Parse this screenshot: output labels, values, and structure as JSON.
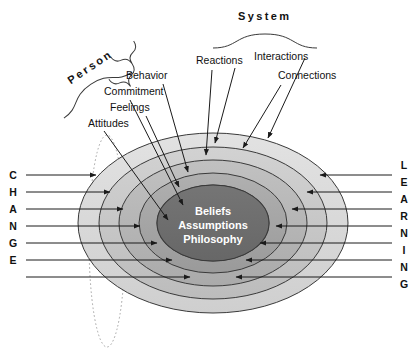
{
  "diagram": {
    "title_groups": [
      {
        "name": "person-group-label",
        "text": "Person"
      },
      {
        "name": "system-group-label",
        "text": "System"
      }
    ],
    "center": {
      "lines": [
        "Beliefs",
        "Assumptions",
        "Philosophy"
      ]
    },
    "person_labels": [
      {
        "text": "Behavior",
        "x": 126,
        "y": 79
      },
      {
        "text": "Commitment",
        "x": 104,
        "y": 95
      },
      {
        "text": "Feelings",
        "x": 110,
        "y": 111
      },
      {
        "text": "Attitudes",
        "x": 88,
        "y": 127
      }
    ],
    "system_labels": [
      {
        "text": "Reactions",
        "x": 196,
        "y": 64
      },
      {
        "text": "Interactions",
        "x": 254,
        "y": 60
      },
      {
        "text": "Connections",
        "x": 278,
        "y": 79
      }
    ],
    "left_axis": {
      "name": "change",
      "letters": [
        "C",
        "H",
        "A",
        "N",
        "G",
        "E"
      ]
    },
    "right_axis": {
      "name": "learning",
      "letters": [
        "L",
        "E",
        "A",
        "R",
        "N",
        "I",
        "N",
        "G"
      ]
    },
    "rings": [
      {
        "index": 0,
        "label": "Attitudes",
        "fill": "#d5d5d5"
      },
      {
        "index": 1,
        "label": "Feelings",
        "fill": "#c3c3c3"
      },
      {
        "index": 2,
        "label": "Commitment",
        "fill": "#b2b2b2"
      },
      {
        "index": 3,
        "label": "Behavior",
        "fill": "#a2a2a2"
      },
      {
        "index": 4,
        "label": "Reactions",
        "fill": "#8e8e8e"
      },
      {
        "index": 5,
        "label": "Core",
        "fill": "#6f6f6f"
      }
    ],
    "colors": {
      "stroke": "#2b2b2b",
      "arrow": "#1a1a1a",
      "dotted": "#9a9a9a",
      "background": "#ffffff"
    }
  }
}
